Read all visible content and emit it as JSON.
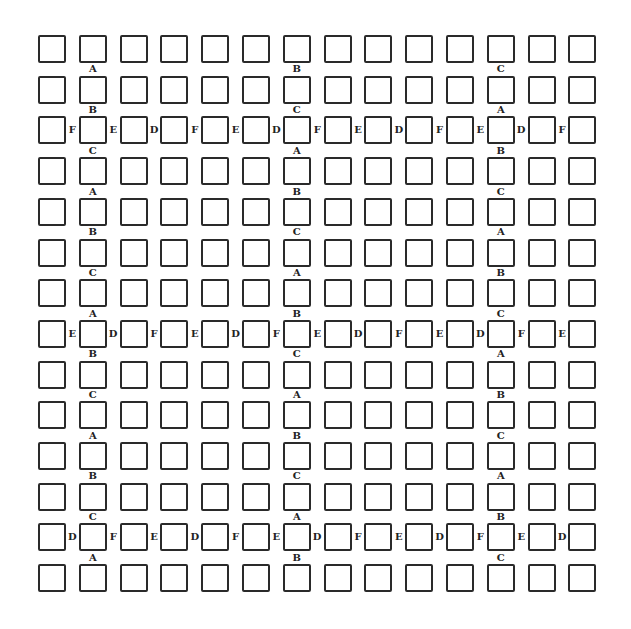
{
  "diagram": {
    "title": "",
    "grid": {
      "rows": 14,
      "cols": 14,
      "origin_x": 38,
      "origin_y": 35,
      "pitch_x": 40.8,
      "pitch_y": 40.7,
      "box_size": 28,
      "box_color": "#2a2a2a",
      "label_color": "#222222"
    },
    "column_labels": [
      {
        "col": 2,
        "labels": [
          {
            "gap_above_row": 2,
            "text": "A"
          },
          {
            "gap_above_row": 3,
            "text": "B"
          },
          {
            "gap_above_row": 4,
            "text": "C"
          },
          {
            "gap_above_row": 5,
            "text": "A"
          },
          {
            "gap_above_row": 6,
            "text": "B"
          },
          {
            "gap_above_row": 7,
            "text": "C"
          },
          {
            "gap_above_row": 8,
            "text": "A"
          },
          {
            "gap_above_row": 9,
            "text": "B"
          },
          {
            "gap_above_row": 10,
            "text": "C"
          },
          {
            "gap_above_row": 11,
            "text": "A"
          },
          {
            "gap_above_row": 12,
            "text": "B"
          },
          {
            "gap_above_row": 13,
            "text": "C"
          },
          {
            "gap_above_row": 14,
            "text": "A"
          }
        ]
      },
      {
        "col": 7,
        "labels": [
          {
            "gap_above_row": 2,
            "text": "B"
          },
          {
            "gap_above_row": 3,
            "text": "C"
          },
          {
            "gap_above_row": 4,
            "text": "A"
          },
          {
            "gap_above_row": 5,
            "text": "B"
          },
          {
            "gap_above_row": 6,
            "text": "C"
          },
          {
            "gap_above_row": 7,
            "text": "A"
          },
          {
            "gap_above_row": 8,
            "text": "B"
          },
          {
            "gap_above_row": 9,
            "text": "C"
          },
          {
            "gap_above_row": 10,
            "text": "A"
          },
          {
            "gap_above_row": 11,
            "text": "B"
          },
          {
            "gap_above_row": 12,
            "text": "C"
          },
          {
            "gap_above_row": 13,
            "text": "A"
          },
          {
            "gap_above_row": 14,
            "text": "B"
          }
        ]
      },
      {
        "col": 12,
        "labels": [
          {
            "gap_above_row": 2,
            "text": "C"
          },
          {
            "gap_above_row": 3,
            "text": "A"
          },
          {
            "gap_above_row": 4,
            "text": "B"
          },
          {
            "gap_above_row": 5,
            "text": "C"
          },
          {
            "gap_above_row": 6,
            "text": "A"
          },
          {
            "gap_above_row": 7,
            "text": "B"
          },
          {
            "gap_above_row": 8,
            "text": "C"
          },
          {
            "gap_above_row": 9,
            "text": "A"
          },
          {
            "gap_above_row": 10,
            "text": "B"
          },
          {
            "gap_above_row": 11,
            "text": "C"
          },
          {
            "gap_above_row": 12,
            "text": "A"
          },
          {
            "gap_above_row": 13,
            "text": "B"
          },
          {
            "gap_above_row": 14,
            "text": "C"
          }
        ]
      }
    ],
    "row_labels": [
      {
        "row": 3,
        "labels": [
          "F",
          "E",
          "D",
          "F",
          "E",
          "D",
          "F",
          "E",
          "D",
          "F",
          "E",
          "D",
          "F"
        ]
      },
      {
        "row": 8,
        "labels": [
          "E",
          "D",
          "F",
          "E",
          "D",
          "F",
          "E",
          "D",
          "F",
          "E",
          "D",
          "F",
          "E"
        ]
      },
      {
        "row": 13,
        "labels": [
          "D",
          "F",
          "E",
          "D",
          "F",
          "E",
          "D",
          "F",
          "E",
          "D",
          "F",
          "E",
          "D"
        ]
      }
    ]
  }
}
